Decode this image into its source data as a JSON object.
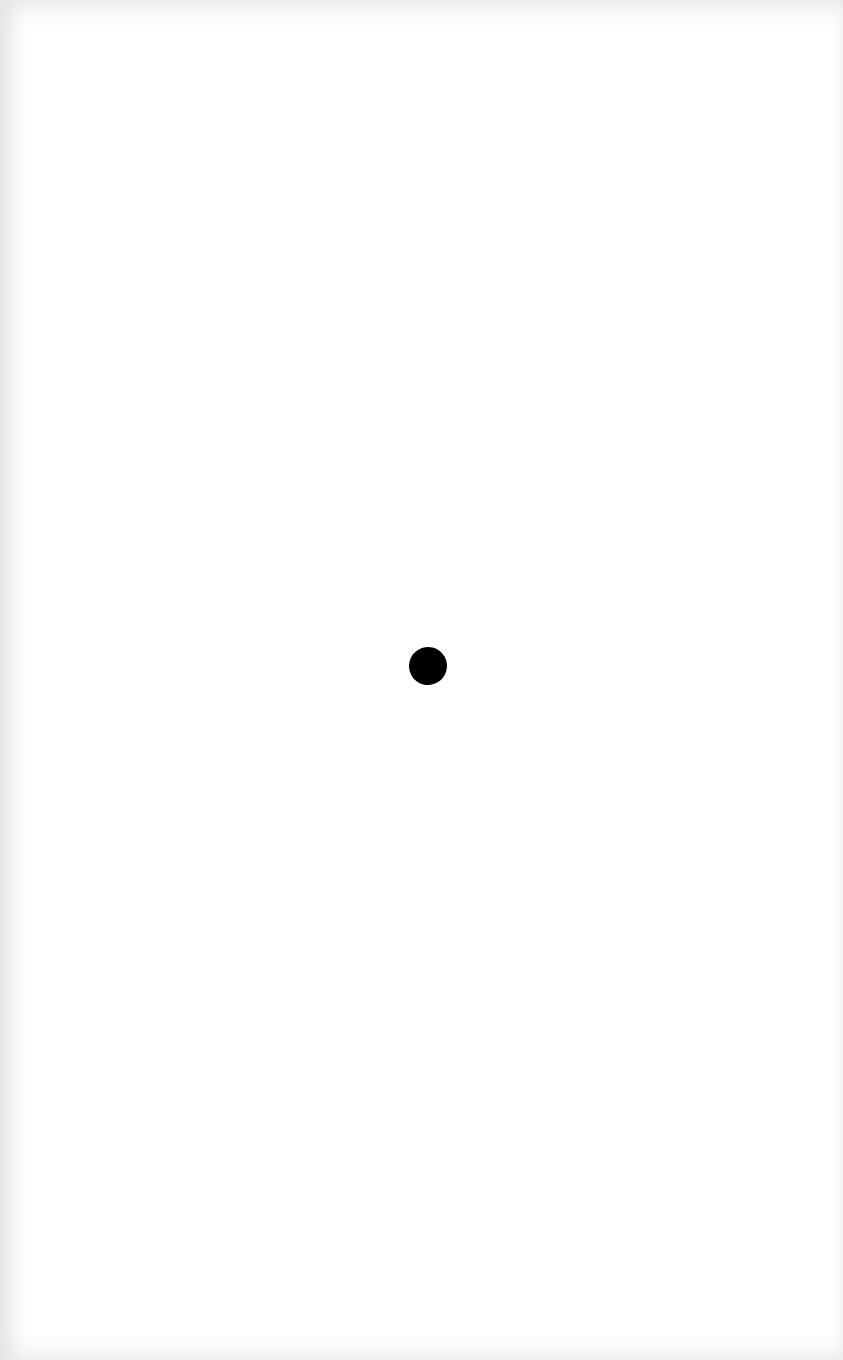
{
  "page": {
    "background": "#ffffff",
    "edge_shade": "#e8e8e8"
  },
  "dot": {
    "color": "#000000",
    "center_x": 428,
    "center_y": 666,
    "width": 38,
    "height": 38
  }
}
